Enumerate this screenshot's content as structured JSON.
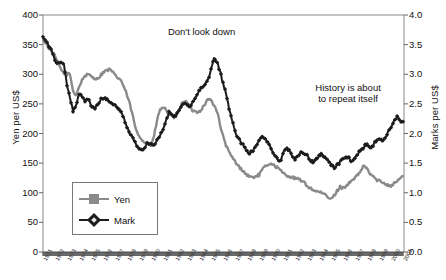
{
  "chart_data": {
    "type": "line",
    "title": "",
    "xlabel": "",
    "ylabel": "Yen per US$",
    "y2label": "Marks per US$",
    "ylim": [
      0,
      400
    ],
    "y2lim": [
      0.0,
      4.0
    ],
    "xlim": [
      "1971",
      "2001"
    ],
    "grid": false,
    "legend_position": "inside-left-lower",
    "y_ticks": [
      "400",
      "350",
      "300",
      "250",
      "200",
      "150",
      "100",
      "50",
      "0"
    ],
    "y2_ticks": [
      "4.0",
      "3.5",
      "3.0",
      "2.5",
      "2.0",
      "1.5",
      "1.0",
      "0.5",
      "0.0"
    ],
    "x_tick_labels": [
      "1971",
      "1972",
      "1973",
      "1974",
      "1975",
      "1976",
      "1977",
      "1978",
      "1979",
      "1980",
      "1981",
      "1982",
      "1983",
      "1984",
      "1985",
      "1986",
      "1987",
      "1988",
      "1989",
      "1990",
      "1991",
      "1992",
      "1993",
      "1994",
      "1995",
      "1996",
      "1997",
      "1998",
      "1999",
      "2000",
      "2001"
    ],
    "annotations": [
      {
        "name": "dont-look-down",
        "lines": [
          "Don't look down"
        ],
        "x_year": 1984.2,
        "y_value": 372
      },
      {
        "name": "history-repeat",
        "lines": [
          "History is about",
          "to repeat itself"
        ],
        "x_year": 1996.4,
        "y_value": 268
      }
    ],
    "series": [
      {
        "name": "Yen",
        "axis": "left",
        "color": "#8a8a8a",
        "marker": "square",
        "x": [
          1971.0,
          1971.25,
          1971.5,
          1971.75,
          1972.0,
          1972.25,
          1972.5,
          1972.75,
          1973.0,
          1973.25,
          1973.5,
          1973.75,
          1974.0,
          1974.25,
          1974.5,
          1974.75,
          1975.0,
          1975.25,
          1975.5,
          1975.75,
          1976.0,
          1976.25,
          1976.5,
          1976.75,
          1977.0,
          1977.25,
          1977.5,
          1977.75,
          1978.0,
          1978.25,
          1978.5,
          1978.75,
          1979.0,
          1979.25,
          1979.5,
          1979.75,
          1980.0,
          1980.25,
          1980.5,
          1980.75,
          1981.0,
          1981.25,
          1981.5,
          1981.75,
          1982.0,
          1982.25,
          1982.5,
          1982.75,
          1983.0,
          1983.25,
          1983.5,
          1983.75,
          1984.0,
          1984.25,
          1984.5,
          1984.75,
          1985.0,
          1985.25,
          1985.5,
          1985.75,
          1986.0,
          1986.25,
          1986.5,
          1986.75,
          1987.0,
          1987.25,
          1987.5,
          1987.75,
          1988.0,
          1988.25,
          1988.5,
          1988.75,
          1989.0,
          1989.25,
          1989.5,
          1989.75,
          1990.0,
          1990.25,
          1990.5,
          1990.75,
          1991.0,
          1991.25,
          1991.5,
          1991.75,
          1992.0,
          1992.25,
          1992.5,
          1992.75,
          1993.0,
          1993.25,
          1993.5,
          1993.75,
          1994.0,
          1994.25,
          1994.5,
          1994.75,
          1995.0,
          1995.25,
          1995.5,
          1995.75,
          1996.0,
          1996.25,
          1996.5,
          1996.75,
          1997.0,
          1997.25,
          1997.5,
          1997.75,
          1998.0,
          1998.25,
          1998.5,
          1998.75,
          1999.0,
          1999.25,
          1999.5,
          1999.75,
          2000.0,
          2000.25,
          2000.5,
          2000.75,
          2001.0
        ],
        "y": [
          358,
          352,
          344,
          338,
          330,
          318,
          308,
          302,
          300,
          300,
          272,
          265,
          278,
          290,
          298,
          299,
          297,
          294,
          292,
          297,
          303,
          306,
          308,
          305,
          298,
          294,
          290,
          278,
          265,
          248,
          228,
          205,
          196,
          190,
          185,
          182,
          180,
          195,
          222,
          240,
          244,
          240,
          232,
          228,
          227,
          235,
          248,
          255,
          252,
          245,
          238,
          237,
          237,
          242,
          250,
          258,
          256,
          248,
          238,
          215,
          195,
          180,
          168,
          160,
          153,
          145,
          141,
          135,
          130,
          127,
          126,
          128,
          130,
          138,
          144,
          148,
          150,
          146,
          143,
          138,
          133,
          130,
          128,
          126,
          124,
          123,
          121,
          117,
          112,
          108,
          105,
          103,
          101,
          99,
          97,
          92,
          89,
          95,
          103,
          110,
          108,
          112,
          116,
          120,
          125,
          130,
          138,
          146,
          140,
          132,
          128,
          122,
          120,
          118,
          116,
          113,
          112,
          116,
          120,
          124,
          128
        ],
        "note": "monthly exchange rate, yen per US dollar; values approximated from plotted curve"
      },
      {
        "name": "Mark",
        "axis": "right",
        "color": "#1c1c1c",
        "marker": "diamond",
        "x": [
          1971.0,
          1971.25,
          1971.5,
          1971.75,
          1972.0,
          1972.25,
          1972.5,
          1972.75,
          1973.0,
          1973.25,
          1973.5,
          1973.75,
          1974.0,
          1974.25,
          1974.5,
          1974.75,
          1975.0,
          1975.25,
          1975.5,
          1975.75,
          1976.0,
          1976.25,
          1976.5,
          1976.75,
          1977.0,
          1977.25,
          1977.5,
          1977.75,
          1978.0,
          1978.25,
          1978.5,
          1978.75,
          1979.0,
          1979.25,
          1979.5,
          1979.75,
          1980.0,
          1980.25,
          1980.5,
          1980.75,
          1981.0,
          1981.25,
          1981.5,
          1981.75,
          1982.0,
          1982.25,
          1982.5,
          1982.75,
          1983.0,
          1983.25,
          1983.5,
          1983.75,
          1984.0,
          1984.25,
          1984.5,
          1984.75,
          1985.0,
          1985.25,
          1985.5,
          1985.75,
          1986.0,
          1986.25,
          1986.5,
          1986.75,
          1987.0,
          1987.25,
          1987.5,
          1987.75,
          1988.0,
          1988.25,
          1988.5,
          1988.75,
          1989.0,
          1989.25,
          1989.5,
          1989.75,
          1990.0,
          1990.25,
          1990.5,
          1990.75,
          1991.0,
          1991.25,
          1991.5,
          1991.75,
          1992.0,
          1992.25,
          1992.5,
          1992.75,
          1993.0,
          1993.25,
          1993.5,
          1993.75,
          1994.0,
          1994.25,
          1994.5,
          1994.75,
          1995.0,
          1995.25,
          1995.5,
          1995.75,
          1996.0,
          1996.25,
          1996.5,
          1996.75,
          1997.0,
          1997.25,
          1997.5,
          1997.75,
          1998.0,
          1998.25,
          1998.5,
          1998.75,
          1999.0,
          1999.25,
          1999.5,
          1999.75,
          2000.0,
          2000.25,
          2000.5,
          2000.75,
          2001.0
        ],
        "y": [
          3.63,
          3.58,
          3.48,
          3.38,
          3.22,
          3.2,
          3.2,
          3.15,
          2.8,
          2.62,
          2.38,
          2.45,
          2.68,
          2.62,
          2.55,
          2.6,
          2.48,
          2.42,
          2.46,
          2.56,
          2.6,
          2.58,
          2.55,
          2.52,
          2.48,
          2.42,
          2.35,
          2.25,
          2.12,
          2.0,
          1.92,
          1.82,
          1.76,
          1.72,
          1.78,
          1.85,
          1.82,
          1.8,
          1.88,
          1.96,
          2.08,
          2.22,
          2.35,
          2.3,
          2.28,
          2.35,
          2.45,
          2.52,
          2.48,
          2.46,
          2.52,
          2.62,
          2.72,
          2.78,
          2.82,
          2.9,
          3.1,
          3.28,
          3.2,
          3.05,
          2.85,
          2.68,
          2.42,
          2.22,
          2.05,
          1.92,
          1.85,
          1.78,
          1.7,
          1.67,
          1.72,
          1.8,
          1.88,
          1.96,
          1.92,
          1.86,
          1.75,
          1.66,
          1.58,
          1.52,
          1.68,
          1.76,
          1.7,
          1.63,
          1.57,
          1.62,
          1.7,
          1.66,
          1.62,
          1.56,
          1.52,
          1.58,
          1.62,
          1.66,
          1.58,
          1.54,
          1.48,
          1.42,
          1.46,
          1.52,
          1.58,
          1.62,
          1.58,
          1.54,
          1.58,
          1.66,
          1.72,
          1.78,
          1.82,
          1.76,
          1.8,
          1.86,
          1.9,
          1.88,
          1.94,
          2.02,
          2.1,
          2.22,
          2.28,
          2.22,
          2.2
        ],
        "note": "monthly exchange rate, German marks per US dollar; values approximated from plotted curve"
      }
    ]
  },
  "legend": {
    "items": [
      {
        "label": "Yen",
        "marker": "square",
        "color": "#8a8a8a"
      },
      {
        "label": "Mark",
        "marker": "diamond",
        "color": "#1c1c1c"
      }
    ]
  },
  "axes": {
    "left_title": "Yen per US$",
    "right_title": "Marks per US$"
  }
}
